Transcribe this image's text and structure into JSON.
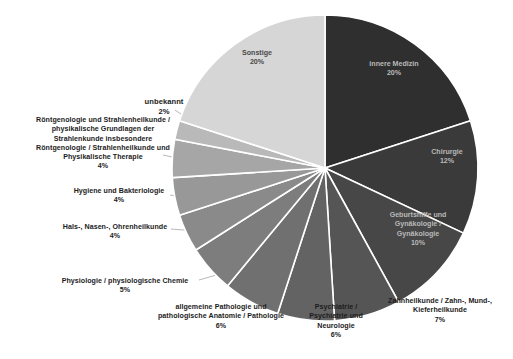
{
  "chart_data": {
    "type": "pie",
    "title": "",
    "subtitle": "",
    "xlabel": "",
    "ylabel": "",
    "legend_position": "none",
    "grid": false,
    "units": "percent",
    "start_angle_deg": 0,
    "direction": "clockwise",
    "categories": [
      "innere Medizin",
      "Chirurgie",
      "Geburtshilfe und Gynäkologie / Gynäkologie",
      "Zahnheilkunde / Zahn-, Mund-, Kieferheilkunde",
      "Psychiatrie / Psychiatrie und Neurologie",
      "allgemeine Pathologie und pathologische Anatomie / Pathologie",
      "Physiologie / physiologische Chemie",
      "Hals-, Nasen-, Ohrenheilkunde",
      "Hygiene und Bakteriologie",
      "Röntgenologie und Strahlenheilkunde / physikalische Grundlagen der Strahlenkunde insbesondere Röntgenologie / Strahlenheilkunde und Physikalische Therapie",
      "unbekannt",
      "Sonstige"
    ],
    "values": [
      20,
      12,
      10,
      7,
      6,
      6,
      5,
      4,
      4,
      4,
      2,
      20
    ],
    "colors": [
      "#2f2f2f",
      "#3a3a3a",
      "#474747",
      "#555555",
      "#636363",
      "#707070",
      "#7d7d7d",
      "#8a8a8a",
      "#989898",
      "#a6a6a6",
      "#b9b9b9",
      "#d6d6d6"
    ],
    "slice_separator_color": "#ffffff"
  },
  "slices": [
    {
      "key": "innere-medizin",
      "name": "innere Medizin",
      "percent_label": "20%",
      "label_text": "innere Medizin\n20%",
      "label_placement": "inside",
      "color": "#2f2f2f"
    },
    {
      "key": "chirurgie",
      "name": "Chirurgie",
      "percent_label": "12%",
      "label_text": "Chirurgie\n12%",
      "label_placement": "inside",
      "color": "#3a3a3a"
    },
    {
      "key": "geburtshilfe-gynaekologie",
      "name": "Geburtshilfe und Gynäkologie / Gynäkologie",
      "percent_label": "10%",
      "label_text": "Geburtshilfe und\nGynäkologie /\nGynäkologie\n10%",
      "label_placement": "inside",
      "color": "#474747"
    },
    {
      "key": "zahnheilkunde",
      "name": "Zahnheilkunde / Zahn-, Mund-, Kieferheilkunde",
      "percent_label": "7%",
      "label_text": "Zahnheilkunde / Zahn-, Mund-,\nKieferheilkunde\n7%",
      "label_placement": "outside",
      "color": "#555555"
    },
    {
      "key": "psychiatrie-neurologie",
      "name": "Psychiatrie / Psychiatrie und Neurologie",
      "percent_label": "6%",
      "label_text": "Psychiatrie /\nPsychiatrie und\nNeurologie\n6%",
      "label_placement": "outside",
      "color": "#636363"
    },
    {
      "key": "allgemeine-pathologie",
      "name": "allgemeine Pathologie und pathologische Anatomie / Pathologie",
      "percent_label": "6%",
      "label_text": "allgemeine Pathologie und\npathologische Anatomie / Pathologie\n6%",
      "label_placement": "outside",
      "color": "#707070"
    },
    {
      "key": "physiologie-chemie",
      "name": "Physiologie / physiologische Chemie",
      "percent_label": "5%",
      "label_text": "Physiologie / physiologische Chemie\n5%",
      "label_placement": "outside",
      "color": "#7d7d7d"
    },
    {
      "key": "hals-nasen-ohrenheilkunde",
      "name": "Hals-, Nasen-, Ohrenheilkunde",
      "percent_label": "4%",
      "label_text": "Hals-, Nasen-, Ohrenheilkunde\n4%",
      "label_placement": "outside",
      "color": "#8a8a8a"
    },
    {
      "key": "hygiene-bakteriologie",
      "name": "Hygiene und Bakteriologie",
      "percent_label": "4%",
      "label_text": "Hygiene und Bakteriologie\n4%",
      "label_placement": "outside",
      "color": "#989898"
    },
    {
      "key": "roentgenologie-strahlenheilkunde",
      "name": "Röntgenologie und Strahlenheilkunde / physikalische Grundlagen der Strahlenkunde insbesondere Röntgenologie / Strahlenheilkunde und Physikalische Therapie",
      "percent_label": "4%",
      "label_text": "Röntgenologie und Strahlenheilkunde /\nphysikalische Grundlagen der\nStrahlenkunde insbesondere\nRöntgenologie / Strahlenheilkunde und\nPhysikalische Therapie\n4%",
      "label_placement": "outside",
      "color": "#a6a6a6"
    },
    {
      "key": "unbekannt",
      "name": "unbekannt",
      "percent_label": "2%",
      "label_text": "unbekannt\n2%",
      "label_placement": "outside",
      "color": "#b9b9b9"
    },
    {
      "key": "sonstige",
      "name": "Sonstige",
      "percent_label": "20%",
      "label_text": "Sonstige\n20%",
      "label_placement": "inside",
      "color": "#d6d6d6"
    }
  ]
}
